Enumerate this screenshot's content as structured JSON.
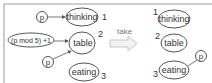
{
  "diagram": {
    "type": "petri-net-transition",
    "colors": {
      "stroke": "#555555",
      "text": "#333333",
      "frame": "#9a9a9a",
      "arrow_fill": "#f2f2f2",
      "arrow_stroke": "#c8c8c8",
      "label_muted": "#777777"
    },
    "before": {
      "places": [
        {
          "name": "thinking",
          "index": "1"
        },
        {
          "name": "table",
          "index": "2"
        },
        {
          "name": "eating",
          "index": "3"
        }
      ],
      "tokens": [
        {
          "label": "p",
          "target": "thinking"
        },
        {
          "label": "(p mod 5) +1",
          "target": "table"
        },
        {
          "label": "p",
          "target": "table"
        }
      ]
    },
    "transition": {
      "label": "take"
    },
    "after": {
      "places": [
        {
          "name": "thinking",
          "index": "1"
        },
        {
          "name": "table",
          "index": "2"
        },
        {
          "name": "eating",
          "index": "3"
        }
      ],
      "tokens": [
        {
          "label": "p",
          "target": "eating"
        }
      ]
    }
  }
}
